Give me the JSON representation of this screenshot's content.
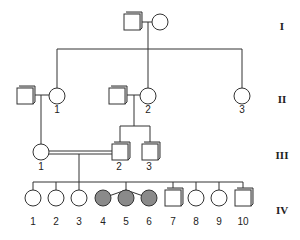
{
  "generations": [
    "I",
    "II",
    "III",
    "IV"
  ],
  "gen2": {
    "labels": [
      "1",
      "2",
      "3"
    ]
  },
  "gen3": {
    "labels": [
      "1",
      "2",
      "3"
    ]
  },
  "gen4": {
    "labels": [
      "1",
      "2",
      "3",
      "4",
      "5",
      "6",
      "7",
      "8",
      "9",
      "10"
    ]
  },
  "colors": {
    "affected": "#8a8a8a",
    "line": "#333333"
  }
}
